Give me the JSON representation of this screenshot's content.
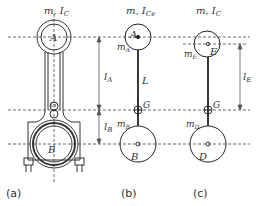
{
  "figure": {
    "panels": [
      {
        "id": "a",
        "caption": "(a)",
        "top_label": "m, I",
        "top_label_sub": "C",
        "point_A": "A",
        "point_G": "G",
        "point_B": "B"
      },
      {
        "id": "b",
        "caption": "(b)",
        "top_label": "m, I",
        "top_label_sub": "Ce",
        "point_A": "A",
        "mass_A": "m",
        "mass_A_sub": "A",
        "rod_label": "L",
        "point_G": "G",
        "mass_B": "m",
        "mass_B_sub": "B",
        "point_B": "B"
      },
      {
        "id": "c",
        "caption": "(c)",
        "top_label": "m, I",
        "top_label_sub": "C",
        "point_E": "E",
        "mass_E": "m",
        "mass_E_sub": "E",
        "point_G": "G",
        "mass_D": "m",
        "mass_D_sub": "D",
        "point_D": "D"
      }
    ],
    "dimensions": {
      "lA": {
        "main": "l",
        "sub": "A"
      },
      "lB": {
        "main": "l",
        "sub": "B"
      },
      "lE": {
        "main": "l",
        "sub": "E"
      }
    }
  }
}
